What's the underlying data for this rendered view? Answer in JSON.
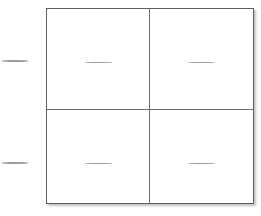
{
  "diagram": {
    "type": "punnett-square-worksheet",
    "grid": {
      "rows": 2,
      "cols": 2,
      "cells": [
        {
          "name": "cell-top-left",
          "row": "row-1",
          "content": "blank-line"
        },
        {
          "name": "cell-top-right",
          "row": "row-1",
          "content": "blank-line"
        },
        {
          "name": "cell-bottom-left",
          "row": "row-2",
          "content": "blank-line"
        },
        {
          "name": "cell-bottom-right",
          "row": "row-2",
          "content": "blank-line"
        }
      ]
    },
    "margin_blanks": [
      {
        "name": "row-1-label-blank",
        "position": "left-of-row-1"
      },
      {
        "name": "row-2-label-blank",
        "position": "left-of-row-2"
      }
    ]
  },
  "colors": {
    "page_background": "#ffffff",
    "cell_background": "#ffffff",
    "grid_outline": "#5e5e5e",
    "grid_inner_line": "#6e6e6e",
    "blank_line": "#9d9d9d"
  }
}
